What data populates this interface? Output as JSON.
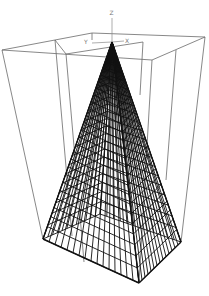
{
  "figure": {
    "type": "3d-wireframe-surface",
    "axes": {
      "z_label": "Z",
      "y_label": "Y",
      "x_label": "X"
    },
    "colors": {
      "background": "#ffffff",
      "mesh": "#111111",
      "box": "#6a6a6a"
    },
    "geometry": {
      "apex": [
        112,
        42
      ],
      "base": {
        "left": [
          43,
          239
        ],
        "front": [
          139,
          283
        ],
        "right": [
          181,
          242
        ],
        "back": [
          100,
          214
        ]
      },
      "outer_box_top": [
        [
          2,
          50
        ],
        [
          92,
          33
        ],
        [
          205,
          37
        ],
        [
          152,
          60
        ]
      ],
      "inner_box_top": [
        [
          55,
          40
        ],
        [
          66,
          54
        ],
        [
          143,
          42
        ],
        [
          92,
          33
        ]
      ]
    }
  }
}
